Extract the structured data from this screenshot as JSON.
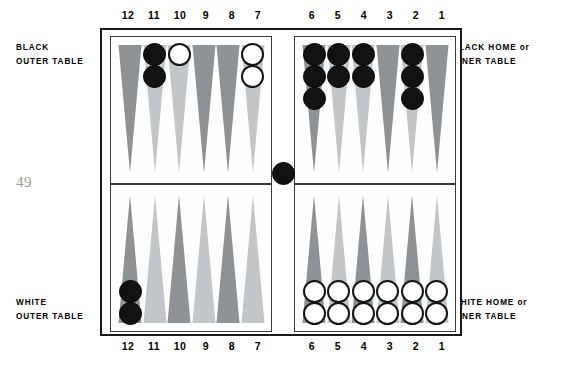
{
  "folio": "49",
  "captions": {
    "black_outer": [
      "BLACK",
      "OUTER TABLE"
    ],
    "white_outer": [
      "WHITE",
      "OUTER TABLE"
    ],
    "black_home": [
      "BLACK HOME or",
      "INNER TABLE"
    ],
    "white_home": [
      "WHITE HOME or",
      "INNER TABLE"
    ]
  },
  "point_numbers": {
    "left_group": [
      "12",
      "11",
      "10",
      "9",
      "8",
      "7"
    ],
    "right_group": [
      "6",
      "5",
      "4",
      "3",
      "2",
      "1"
    ]
  },
  "colors": {
    "black_checker": "#121212",
    "white_checker": "#ffffff",
    "checker_outline": "#141414",
    "point_dark": "#8f9295",
    "point_light": "#c3c6c8",
    "frame": "#1a1a1a",
    "quadrant_border": "#3a3a3a",
    "board_background": "#fefefe",
    "folio_color": "#9b9b9b"
  },
  "board": {
    "type": "backgammon-board",
    "bar_checkers": [
      {
        "color": "black",
        "count": 1
      }
    ],
    "points": [
      {
        "number": "12",
        "quadrant": "top-left",
        "shade": "dark",
        "checkers": {
          "color": null,
          "count": 0
        }
      },
      {
        "number": "11",
        "quadrant": "top-left",
        "shade": "light",
        "checkers": {
          "color": "black",
          "count": 2
        }
      },
      {
        "number": "10",
        "quadrant": "top-left",
        "shade": "light",
        "checkers": {
          "color": "white",
          "count": 1
        }
      },
      {
        "number": "9",
        "quadrant": "top-left",
        "shade": "dark",
        "checkers": {
          "color": null,
          "count": 0
        }
      },
      {
        "number": "8",
        "quadrant": "top-left",
        "shade": "dark",
        "checkers": {
          "color": null,
          "count": 0
        }
      },
      {
        "number": "7",
        "quadrant": "top-left",
        "shade": "light",
        "checkers": {
          "color": "white",
          "count": 2
        }
      },
      {
        "number": "6",
        "quadrant": "top-right",
        "shade": "dark",
        "checkers": {
          "color": "black",
          "count": 3
        }
      },
      {
        "number": "5",
        "quadrant": "top-right",
        "shade": "light",
        "checkers": {
          "color": "black",
          "count": 2
        }
      },
      {
        "number": "4",
        "quadrant": "top-right",
        "shade": "light",
        "checkers": {
          "color": "black",
          "count": 2
        }
      },
      {
        "number": "3",
        "quadrant": "top-right",
        "shade": "dark",
        "checkers": {
          "color": null,
          "count": 0
        }
      },
      {
        "number": "2",
        "quadrant": "top-right",
        "shade": "light",
        "checkers": {
          "color": "black",
          "count": 3
        }
      },
      {
        "number": "1",
        "quadrant": "top-right",
        "shade": "dark",
        "checkers": {
          "color": null,
          "count": 0
        }
      },
      {
        "number": "12",
        "quadrant": "bottom-left",
        "shade": "dark",
        "checkers": {
          "color": "black",
          "count": 2
        }
      },
      {
        "number": "11",
        "quadrant": "bottom-left",
        "shade": "light",
        "checkers": {
          "color": null,
          "count": 0
        }
      },
      {
        "number": "10",
        "quadrant": "bottom-left",
        "shade": "dark",
        "checkers": {
          "color": null,
          "count": 0
        }
      },
      {
        "number": "9",
        "quadrant": "bottom-left",
        "shade": "light",
        "checkers": {
          "color": null,
          "count": 0
        }
      },
      {
        "number": "8",
        "quadrant": "bottom-left",
        "shade": "dark",
        "checkers": {
          "color": null,
          "count": 0
        }
      },
      {
        "number": "7",
        "quadrant": "bottom-left",
        "shade": "light",
        "checkers": {
          "color": null,
          "count": 0
        }
      },
      {
        "number": "6",
        "quadrant": "bottom-right",
        "shade": "dark",
        "checkers": {
          "color": "white",
          "count": 2
        }
      },
      {
        "number": "5",
        "quadrant": "bottom-right",
        "shade": "light",
        "checkers": {
          "color": "white",
          "count": 2
        }
      },
      {
        "number": "4",
        "quadrant": "bottom-right",
        "shade": "dark",
        "checkers": {
          "color": "white",
          "count": 2
        }
      },
      {
        "number": "3",
        "quadrant": "bottom-right",
        "shade": "light",
        "checkers": {
          "color": "white",
          "count": 2
        }
      },
      {
        "number": "2",
        "quadrant": "bottom-right",
        "shade": "dark",
        "checkers": {
          "color": "white",
          "count": 2
        }
      },
      {
        "number": "1",
        "quadrant": "bottom-right",
        "shade": "light",
        "checkers": {
          "color": "white",
          "count": 2
        }
      }
    ]
  }
}
